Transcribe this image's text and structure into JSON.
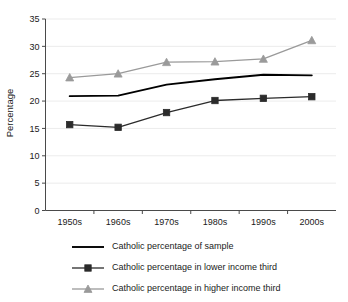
{
  "chart_data": {
    "type": "line",
    "title": "",
    "xlabel": "",
    "ylabel": "Percentage",
    "categories": [
      "1950s",
      "1960s",
      "1970s",
      "1980s",
      "1990s",
      "2000s"
    ],
    "ylim": [
      0,
      35
    ],
    "yticks": [
      0,
      5,
      10,
      15,
      20,
      25,
      30,
      35
    ],
    "grid": true,
    "legend_position": "bottom",
    "series": [
      {
        "name": "Catholic percentage of sample",
        "marker": "none",
        "color": "#000000",
        "values": [
          20.9,
          21.0,
          23.0,
          24.0,
          24.8,
          24.7
        ]
      },
      {
        "name": "Catholic percentage in lower income third",
        "marker": "square",
        "color": "#2b2b2b",
        "values": [
          15.7,
          15.2,
          17.9,
          20.1,
          20.5,
          20.8
        ]
      },
      {
        "name": "Catholic percentage in higher income third",
        "marker": "triangle",
        "color": "#9a9a9a",
        "values": [
          24.3,
          25.0,
          27.1,
          27.2,
          27.7,
          31.1
        ]
      }
    ]
  },
  "axis": {
    "y_title": "Percentage",
    "y_tick_labels": [
      "35",
      "30",
      "25",
      "20",
      "15",
      "10",
      "5",
      "0"
    ],
    "x_tick_labels": [
      "1950s",
      "1960s",
      "1970s",
      "1980s",
      "1990s",
      "2000s"
    ]
  },
  "legend": {
    "entries": [
      {
        "label": "Catholic percentage of sample",
        "marker": "line",
        "color": "#000000"
      },
      {
        "label": "Catholic percentage in lower income third",
        "marker": "square",
        "color": "#2b2b2b"
      },
      {
        "label": "Catholic percentage in higher income third",
        "marker": "triangle",
        "color": "#9a9a9a"
      }
    ]
  }
}
